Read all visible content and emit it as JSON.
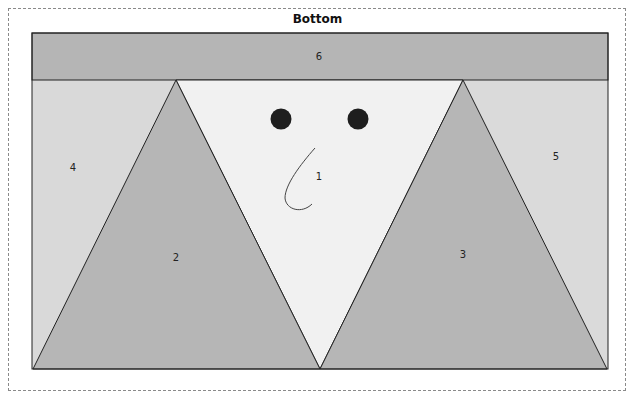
{
  "title": "Bottom",
  "colors": {
    "band": "#b5b5b5",
    "side_panel": "#d9d9d9",
    "center_triangle": "#f1f1f1",
    "side_triangle": "#b6b6b6",
    "outline": "#222222",
    "eye": "#1e1e1e",
    "dashed_border": "#8a8a8a"
  },
  "regions": [
    {
      "id": "1",
      "label": "1",
      "shape": "inverted-triangle",
      "fill": "light"
    },
    {
      "id": "2",
      "label": "2",
      "shape": "triangle",
      "fill": "medium"
    },
    {
      "id": "3",
      "label": "3",
      "shape": "triangle",
      "fill": "medium"
    },
    {
      "id": "4",
      "label": "4",
      "shape": "side-panel-left",
      "fill": "light-gray"
    },
    {
      "id": "5",
      "label": "5",
      "shape": "side-panel-right",
      "fill": "light-gray"
    },
    {
      "id": "6",
      "label": "6",
      "shape": "top-band",
      "fill": "medium"
    }
  ],
  "face": {
    "eyes": 2,
    "nose": "curved-line"
  }
}
